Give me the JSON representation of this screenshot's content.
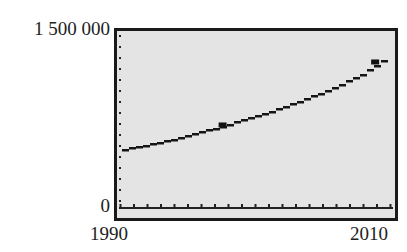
{
  "chart_data": {
    "type": "line",
    "title": "",
    "xlabel": "",
    "ylabel": "",
    "xlim": [
      1990,
      2010
    ],
    "ylim": [
      0,
      1500000
    ],
    "x_tick_labels": [
      "1990",
      "2010"
    ],
    "y_tick_labels": [
      "0",
      "1 500 000"
    ],
    "grid": false,
    "legend": null,
    "series": [
      {
        "name": "model",
        "x": [
          1990,
          1992,
          1994,
          1996,
          1998,
          2000,
          2002,
          2004,
          2006,
          2008,
          2010
        ],
        "values": [
          486000,
          530000,
          580000,
          640000,
          705000,
          775000,
          850000,
          935000,
          1030000,
          1140000,
          1300000
        ]
      }
    ],
    "highlighted_points": [
      {
        "x": 1997.6,
        "y": 699000
      },
      {
        "x": 2008.9,
        "y": 1236000
      }
    ],
    "style": "graphing calculator screen with dotted y-axis and tick-marked x-axis"
  },
  "labels": {
    "y_max": "1 500 000",
    "y_min": "0",
    "x_min": "1990",
    "x_max": "2010"
  }
}
